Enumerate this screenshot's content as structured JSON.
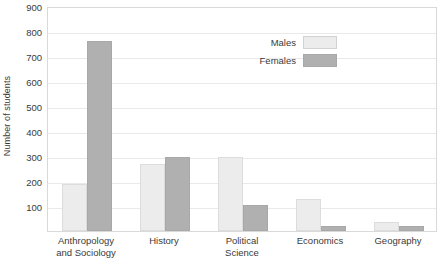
{
  "chart_data": {
    "type": "bar",
    "title": "",
    "xlabel": "",
    "ylabel": "Number of students",
    "ylim": [
      0,
      900
    ],
    "ytick_step": 100,
    "yticks": [
      0,
      100,
      200,
      300,
      400,
      500,
      600,
      700,
      800,
      900
    ],
    "ytick_labels": [
      "",
      "100",
      "200",
      "300",
      "400",
      "500",
      "600",
      "700",
      "800",
      "900"
    ],
    "grid": true,
    "legend_position": "upper right inside",
    "categories": [
      "Anthropology and Sociology",
      "History",
      "Political Science",
      "Economics",
      "Geography"
    ],
    "category_lines": [
      [
        "Anthropology",
        "and Sociology"
      ],
      [
        "History"
      ],
      [
        "Political",
        "Science"
      ],
      [
        "Economics"
      ],
      [
        "Geography"
      ]
    ],
    "series": [
      {
        "name": "Males",
        "color": "#ececec",
        "values": [
          190,
          270,
          295,
          128,
          35
        ]
      },
      {
        "name": "Females",
        "color": "#b0b0b0",
        "values": [
          760,
          298,
          105,
          20,
          20
        ]
      }
    ]
  },
  "legend": {
    "items": [
      {
        "label": "Males",
        "swatch": "males"
      },
      {
        "label": "Females",
        "swatch": "females"
      }
    ]
  },
  "colors": {
    "males": "#ececec",
    "females": "#b0b0b0",
    "grid": "#e9e9e9",
    "frame": "#d9d9d9",
    "text": "#3a3a3a",
    "background": "#ffffff"
  }
}
